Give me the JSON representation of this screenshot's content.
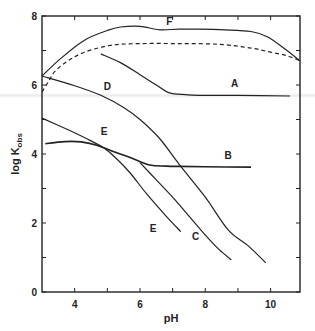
{
  "chart_data": {
    "type": "line",
    "title": "",
    "xlabel": "pH",
    "ylabel": "log K_obs",
    "ylabel_main": "log K",
    "ylabel_sub": "obs",
    "xlim": [
      3.0,
      10.9
    ],
    "ylim": [
      0,
      8
    ],
    "x_ticks": [
      4,
      5,
      6,
      7,
      8,
      9,
      10
    ],
    "x_tick_labels": [
      "4",
      "",
      "6",
      "",
      "8",
      "",
      "10"
    ],
    "y_ticks": [
      0,
      1,
      2,
      3,
      4,
      5,
      6,
      7,
      8
    ],
    "y_tick_labels": [
      "0",
      "",
      "2",
      "",
      "4",
      "",
      "6",
      "",
      "8"
    ],
    "grid": false,
    "legend": "inline curve labels",
    "series": [
      {
        "name": "F",
        "style": "solid",
        "label_pos": [
          6.9,
          7.75
        ],
        "x": [
          3.0,
          3.55,
          4.3,
          5.0,
          5.4,
          6.0,
          6.6,
          7.2,
          7.8,
          8.6,
          9.4,
          9.9,
          10.4,
          10.9
        ],
        "y": [
          6.26,
          6.75,
          7.3,
          7.58,
          7.68,
          7.7,
          7.6,
          7.62,
          7.62,
          7.6,
          7.55,
          7.4,
          7.07,
          6.7
        ]
      },
      {
        "name": "dashed",
        "style": "dashed",
        "label_pos": null,
        "x": [
          3.0,
          3.2,
          3.4,
          3.8,
          4.3,
          5.1,
          6.0,
          7.2,
          8.4,
          9.4,
          10.0,
          10.5,
          10.9
        ],
        "y": [
          5.8,
          6.1,
          6.4,
          6.7,
          6.95,
          7.15,
          7.2,
          7.2,
          7.18,
          7.07,
          6.95,
          6.85,
          6.7
        ]
      },
      {
        "name": "A",
        "style": "solid",
        "label_pos": [
          8.9,
          5.95
        ],
        "x": [
          4.8,
          5.4,
          6.0,
          6.5,
          6.9,
          7.4,
          7.8,
          9.0,
          10.6
        ],
        "y": [
          6.9,
          6.65,
          6.3,
          6.0,
          5.77,
          5.72,
          5.7,
          5.7,
          5.68
        ],
        "line_end_x": 10.6
      },
      {
        "name": "D",
        "style": "solid",
        "label_pos": [
          5.0,
          5.85
        ],
        "x": [
          3.0,
          4.0,
          4.8,
          5.5,
          6.0,
          6.6,
          7.2,
          8.0,
          8.7,
          9.3,
          9.85
        ],
        "y": [
          6.26,
          5.98,
          5.7,
          5.35,
          5.0,
          4.45,
          3.7,
          2.75,
          1.8,
          1.35,
          0.85
        ]
      },
      {
        "name": "E",
        "style": "solid",
        "label_pos": [
          4.9,
          4.55
        ],
        "label2_pos": [
          6.4,
          1.75
        ],
        "x": [
          3.0,
          3.8,
          4.5,
          4.9,
          5.3,
          5.7,
          6.2,
          6.8,
          7.25
        ],
        "y": [
          5.04,
          4.7,
          4.38,
          4.17,
          3.85,
          3.45,
          2.85,
          2.2,
          1.75
        ]
      },
      {
        "name": "C",
        "style": "solid",
        "label_pos": [
          7.7,
          1.5
        ],
        "x": [
          6.0,
          6.5,
          7.0,
          7.5,
          8.0,
          8.4,
          8.8
        ],
        "y": [
          3.75,
          3.25,
          2.75,
          2.2,
          1.65,
          1.25,
          0.93
        ]
      },
      {
        "name": "B",
        "style": "solid",
        "label_pos": [
          8.7,
          3.85
        ],
        "x": [
          3.1,
          3.7,
          4.2,
          4.7,
          5.1,
          5.7,
          6.3,
          6.8,
          7.2,
          8.0,
          9.4
        ],
        "y": [
          4.3,
          4.36,
          4.35,
          4.25,
          4.1,
          3.9,
          3.68,
          3.65,
          3.64,
          3.63,
          3.62
        ]
      }
    ]
  }
}
